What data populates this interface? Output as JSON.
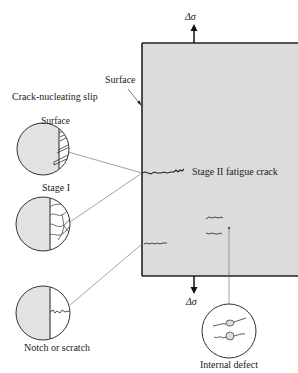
{
  "diagram": {
    "stress_top": "Δσ",
    "stress_bottom": "Δσ",
    "surface_label": "Surface",
    "crack_stage2_label": "Stage II fatigue crack",
    "insets": [
      {
        "title": "Crack-nucleating slip",
        "inner_label": "Surface"
      },
      {
        "title": "Stage I"
      },
      {
        "title": "Notch or scratch"
      },
      {
        "title": "Internal defect"
      }
    ],
    "colors": {
      "specimen_fill": "#dcdcdc",
      "outline": "#222222",
      "leader": "#555555"
    }
  }
}
